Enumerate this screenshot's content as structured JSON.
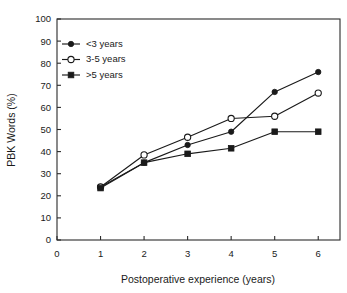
{
  "chart_data": {
    "type": "line",
    "title": "",
    "xlabel": "Postoperative experience (years)",
    "ylabel": "PBK Words (%)",
    "xlim": [
      0,
      6.5
    ],
    "ylim": [
      0,
      100
    ],
    "xticks": [
      "0",
      "1",
      "2",
      "3",
      "4",
      "5",
      "6"
    ],
    "yticks": [
      "0",
      "10",
      "20",
      "30",
      "40",
      "50",
      "60",
      "70",
      "80",
      "90",
      "100"
    ],
    "grid": false,
    "legend_position": "upper left",
    "x": [
      1,
      2,
      3,
      4,
      5,
      6
    ],
    "series": [
      {
        "name": "<3 years",
        "marker": "filled-circle",
        "values": [
          24,
          35,
          43,
          49,
          67,
          76
        ]
      },
      {
        "name": "3-5 years",
        "marker": "open-circle",
        "values": [
          24,
          38.5,
          46.5,
          55,
          56,
          66.5
        ]
      },
      {
        "name": ">5 years",
        "marker": "filled-square",
        "values": [
          23.5,
          35,
          39,
          41.5,
          49,
          49
        ]
      }
    ],
    "colors": {
      "axis": "#2b2b2b",
      "line": "#1a1a1a",
      "background": "#ffffff"
    }
  }
}
